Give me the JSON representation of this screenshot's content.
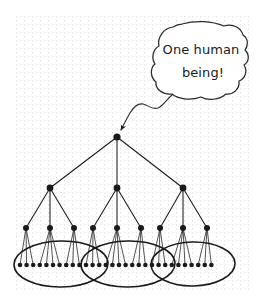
{
  "figure": {
    "type": "hand-drawn-diagram",
    "background_color": "#ffffff",
    "ink_color": "#1a1a1a",
    "grid": {
      "visible": true,
      "style": "dotted-vertical-and-horizontal",
      "color": "#e3e3e3",
      "spacing_px": 8,
      "bounds": {
        "x": 15,
        "y": 14,
        "width": 236,
        "height": 277
      }
    }
  },
  "callout": {
    "kind": "speech-bubble",
    "shape": "irregular-hand-drawn-blob",
    "lines": [
      "One human",
      "being!"
    ],
    "full_text": "One human being!",
    "bounds": {
      "x": 152,
      "y": 22,
      "width": 98,
      "height": 78
    },
    "tail": {
      "kind": "wavy-curve-with-arrowhead",
      "from": {
        "x": 172,
        "y": 96
      },
      "to": {
        "x": 121,
        "y": 131
      },
      "arrowhead": "filled-triangle",
      "points_at": "root-node"
    }
  },
  "tree": {
    "node_color": "#1a1a1a",
    "edge_color": "#1a1a1a",
    "levels": [
      {
        "name": "root",
        "depth": 0,
        "y": 137,
        "radius": 3.6,
        "count": 1,
        "x_positions": [
          117
        ]
      },
      {
        "name": "level-2",
        "depth": 1,
        "y": 188,
        "radius": 3.4,
        "count": 3,
        "x_positions": [
          50,
          117,
          183
        ]
      },
      {
        "name": "level-3",
        "depth": 2,
        "y": 228,
        "radius": 3.0,
        "count": 9,
        "x_positions": [
          26,
          50,
          74,
          93,
          117,
          141,
          160,
          183,
          207
        ]
      },
      {
        "name": "leaves",
        "depth": 3,
        "y": 265,
        "radius": 2.3,
        "count": 30,
        "x_start": 20,
        "x_step": 6.6
      }
    ]
  },
  "groupings": {
    "kind": "hand-drawn-ellipses",
    "count": 3,
    "overlapping": true,
    "ellipses": [
      {
        "cx": 61,
        "cy": 264,
        "rx": 47,
        "ry": 23,
        "rotate": -1
      },
      {
        "cx": 128,
        "cy": 264,
        "rx": 47,
        "ry": 23,
        "rotate": -1
      },
      {
        "cx": 193,
        "cy": 264,
        "rx": 42,
        "ry": 22,
        "rotate": -1
      }
    ]
  }
}
